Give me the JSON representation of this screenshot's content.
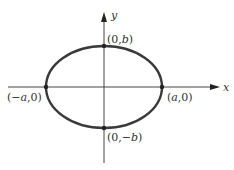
{
  "diagram": {
    "type": "ellipse-on-axes",
    "colors": {
      "background": "#ffffff",
      "axis": "#444444",
      "ellipse": "#3a3a3a",
      "text": "#333333"
    },
    "axes": {
      "x_label": "x",
      "y_label": "y"
    },
    "ellipse": {
      "center": [
        104,
        87
      ],
      "rx": 58,
      "ry": 41
    },
    "points": [
      {
        "id": "top",
        "open": "(0,",
        "var": "b",
        "close": ")"
      },
      {
        "id": "left",
        "open": "(−",
        "var": "a",
        "close": ",0)"
      },
      {
        "id": "right",
        "open": "(",
        "var": "a",
        "close": ",0)"
      },
      {
        "id": "bottom",
        "open": "(0,−",
        "var": "b",
        "close": ")"
      }
    ]
  }
}
